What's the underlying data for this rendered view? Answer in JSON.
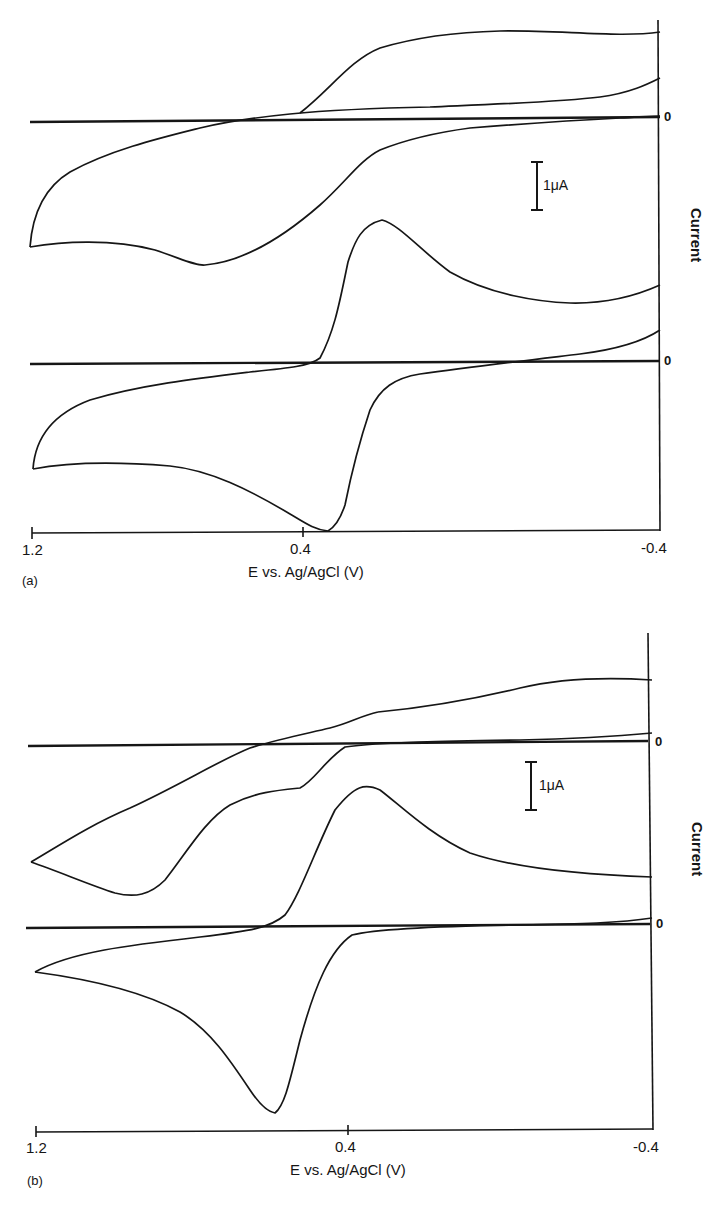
{
  "figure": {
    "panels": [
      {
        "tag": "(a)",
        "x_label": "E vs. Ag/AgCl (V)",
        "y_label": "Current",
        "x_ticks": [
          "1.2",
          "0.4",
          "-0.4"
        ],
        "zero_labels": [
          "0",
          "0"
        ],
        "scale_bar": "1μA"
      },
      {
        "tag": "(b)",
        "x_label": "E vs. Ag/AgCl (V)",
        "y_label": "Current",
        "x_ticks": [
          "1.2",
          "0.4",
          "-0.4"
        ],
        "zero_labels": [
          "0",
          "0"
        ],
        "scale_bar": "1μA"
      }
    ]
  },
  "chart_data": [
    {
      "type": "line",
      "title": "(a)",
      "xlabel": "E vs. Ag/AgCl (V)",
      "ylabel": "Current",
      "xlim": [
        1.2,
        -0.4
      ],
      "x_ticks": [
        1.2,
        0.4,
        -0.4
      ],
      "scale_bar": "1 μA",
      "grid": false,
      "legend": null,
      "annotations": [
        "0 (baseline, upper voltammogram)",
        "0 (baseline, lower voltammogram)"
      ],
      "series": [
        {
          "name": "upper voltammogram (cathodic/anodic sweep, uA offset from baseline 0)",
          "x": [
            1.2,
            1.1,
            1.0,
            0.9,
            0.8,
            0.7,
            0.6,
            0.5,
            0.45,
            0.4,
            0.35,
            0.3,
            0.2,
            0.1,
            0.0,
            -0.1,
            -0.2,
            -0.3,
            -0.4
          ],
          "forward_uA": [
            -2.5,
            -2.5,
            -2.55,
            -2.7,
            -2.85,
            -2.75,
            -2.4,
            -1.9,
            -1.5,
            -1.1,
            -0.7,
            -0.45,
            -0.3,
            -0.2,
            -0.1,
            0.0,
            0.1,
            0.35,
            0.6
          ],
          "reverse_uA": [
            -2.5,
            -1.6,
            -1.25,
            -1.0,
            -0.8,
            -0.55,
            -0.35,
            -0.15,
            -0.05,
            0.0,
            0.3,
            0.75,
            1.6,
            1.75,
            1.8,
            1.85,
            1.8,
            1.75,
            1.8
          ]
        },
        {
          "name": "lower voltammogram (uA offset from baseline 0)",
          "x": [
            1.2,
            1.1,
            1.0,
            0.9,
            0.8,
            0.7,
            0.6,
            0.5,
            0.45,
            0.4,
            0.35,
            0.3,
            0.2,
            0.1,
            0.0,
            -0.1,
            -0.2,
            -0.3,
            -0.4
          ],
          "forward_uA": [
            -2.2,
            -2.1,
            -2.05,
            -2.1,
            -2.2,
            -2.35,
            -2.6,
            -3.0,
            -3.35,
            -3.5,
            -2.6,
            -1.3,
            -0.55,
            -0.35,
            -0.2,
            -0.1,
            0.0,
            0.15,
            0.45
          ],
          "reverse_uA": [
            -2.2,
            -1.3,
            -1.05,
            -0.9,
            -0.8,
            -0.7,
            -0.6,
            -0.45,
            -0.3,
            0.0,
            2.0,
            2.9,
            2.0,
            1.45,
            1.2,
            1.05,
            1.05,
            1.15,
            1.1
          ]
        }
      ]
    },
    {
      "type": "line",
      "title": "(b)",
      "xlabel": "E vs. Ag/AgCl (V)",
      "ylabel": "Current",
      "xlim": [
        1.2,
        -0.4
      ],
      "x_ticks": [
        1.2,
        0.4,
        -0.4
      ],
      "scale_bar": "1 μA",
      "grid": false,
      "legend": null,
      "annotations": [
        "0 (baseline, upper voltammogram)",
        "0 (baseline, lower voltammogram)"
      ],
      "series": [
        {
          "name": "upper voltammogram (uA offset from baseline 0)",
          "x": [
            1.2,
            1.1,
            1.0,
            0.9,
            0.8,
            0.7,
            0.6,
            0.5,
            0.45,
            0.4,
            0.35,
            0.3,
            0.2,
            0.1,
            0.0,
            -0.1,
            -0.2,
            -0.3,
            -0.4
          ],
          "forward_uA": [
            -1.8,
            -2.1,
            -2.3,
            -2.2,
            -1.6,
            -1.0,
            -0.65,
            -0.6,
            -0.45,
            -0.2,
            -0.05,
            0.0,
            0.05,
            0.05,
            0.1,
            0.1,
            0.15,
            0.2,
            0.25
          ],
          "reverse_uA": [
            -1.8,
            -1.35,
            -1.05,
            -0.75,
            -0.45,
            -0.15,
            0.05,
            0.35,
            0.6,
            0.8,
            0.7,
            0.75,
            0.8,
            0.95,
            1.1,
            1.2,
            1.25,
            1.2,
            1.2
          ]
        },
        {
          "name": "lower voltammogram (uA offset from baseline 0)",
          "x": [
            1.2,
            1.1,
            1.0,
            0.9,
            0.8,
            0.7,
            0.6,
            0.5,
            0.45,
            0.4,
            0.35,
            0.3,
            0.2,
            0.1,
            0.0,
            -0.1,
            -0.2,
            -0.3,
            -0.4
          ],
          "forward_uA": [
            -1.5,
            -1.6,
            -1.8,
            -2.1,
            -2.8,
            -3.5,
            -3.9,
            -2.6,
            -1.3,
            -0.3,
            -0.1,
            -0.05,
            0.0,
            0.0,
            0.0,
            0.05,
            0.05,
            0.1,
            0.2
          ],
          "reverse_uA": [
            -1.5,
            -1.15,
            -1.0,
            -0.9,
            -0.8,
            -0.7,
            -0.5,
            0.5,
            1.6,
            2.6,
            3.1,
            2.5,
            1.6,
            1.0,
            0.7,
            0.55,
            0.5,
            0.45,
            0.45
          ]
        }
      ]
    }
  ],
  "render": {
    "a": {
      "axis": {
        "x0": 32,
        "x1": 660,
        "y": 532,
        "top": 20,
        "tick_mid": 303
      },
      "baselines": [
        117,
        361
      ],
      "scale_bar": {
        "x": 537,
        "y0": 162,
        "y1": 210
      },
      "curves": [
        "M30,247 C32,220 40,190 70,172 C110,150 160,138 200,128 C230,121 260,117 290,114 C330,110 380,108 430,107 C500,104 560,102 600,97 C630,93 648,84 660,78",
        "M30,247 C60,242 110,238 155,250 C180,258 195,266 205,265 C240,262 280,240 320,205 C345,183 360,160 380,150 C410,138 440,132 470,128 C520,124 580,120 620,118 C640,117 652,116 660,116",
        "M300,113 C330,90 350,60 380,48 C420,36 460,32 500,31 C560,30 620,38 660,32",
        "M33,469 C35,440 50,415 90,400 C140,385 200,378 250,372 C290,368 310,366 320,358 C335,330 340,300 348,262 C355,240 362,225 382,220 C400,225 420,250 450,272 C490,295 540,302 570,303 C610,304 640,294 660,285",
        "M33,469 C70,462 120,462 170,466 C210,470 250,490 290,514 C305,523 315,530 328,531 C335,527 340,520 345,505 C352,470 360,440 370,410 C380,388 395,378 420,374 C470,367 530,360 580,354 C620,349 645,340 660,330"
      ]
    },
    "b": {
      "axis": {
        "x0": 36,
        "x1": 652,
        "y": 1130,
        "top": 633,
        "tick_mid": 348
      },
      "baselines": [
        742,
        925
      ],
      "scale_bar": {
        "x": 531,
        "y0": 762,
        "y1": 810
      },
      "curves": [
        "M31,862 C60,845 90,825 130,808 C180,785 220,760 250,748 C275,740 300,735 330,728 C350,723 360,716 378,712",
        "M378,712 C420,708 470,700 520,688 C570,676 620,678 652,680",
        "M31,862 C60,872 90,885 115,893 C135,898 150,895 165,880 C185,855 205,820 230,805 C255,792 280,790 300,788 C315,780 325,760 345,747 C380,742 450,741 520,740 C570,739 620,736 652,733",
        "M35,972 C70,952 130,945 200,937 C250,931 270,928 285,915 C300,895 315,850 335,810 C355,785 365,783 380,790 C400,805 430,835 470,853 C520,870 590,875 652,877",
        "M35,972 C80,978 140,990 180,1012 C210,1030 230,1060 250,1090 C260,1105 268,1112 275,1113 C285,1105 290,1080 300,1040 C315,985 330,950 352,935 C380,928 450,926 520,925 C580,924 620,923 652,918"
      ]
    }
  }
}
